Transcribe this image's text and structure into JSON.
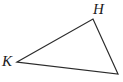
{
  "figure": {
    "type": "geometry-diagram",
    "shape": "triangle",
    "background_color": "#ffffff",
    "stroke_color": "#2b2b2b",
    "stroke_width": 1.2,
    "canvas": {
      "width": 123,
      "height": 82
    },
    "vertices": [
      {
        "id": "H",
        "label": "H",
        "x": 93,
        "y": 19,
        "label_x": 93,
        "label_y": 2
      },
      {
        "id": "K",
        "label": "K",
        "x": 17,
        "y": 62,
        "label_x": 2,
        "label_y": 54
      },
      {
        "id": "unlabeled",
        "label": "",
        "x": 118,
        "y": 74
      }
    ],
    "edges": [
      {
        "from": "K",
        "to": "H"
      },
      {
        "from": "H",
        "to": "unlabeled"
      },
      {
        "from": "unlabeled",
        "to": "K"
      }
    ],
    "labels": {
      "H": "H",
      "K": "K"
    }
  }
}
